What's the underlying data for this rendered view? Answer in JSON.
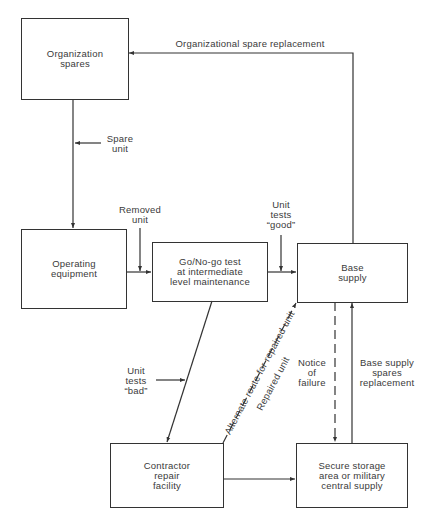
{
  "diagram": {
    "type": "flowchart",
    "nodes": [
      {
        "id": "org_spares",
        "label": "Organization\nspares"
      },
      {
        "id": "operating_equipment",
        "label": "Operating\nequipment"
      },
      {
        "id": "go_nogo",
        "label": "Go/No-go test\nat intermediate\nlevel maintenance"
      },
      {
        "id": "base_supply",
        "label": "Base\nsupply"
      },
      {
        "id": "contractor",
        "label": "Contractor\nrepair\nfacility"
      },
      {
        "id": "secure_storage",
        "label": "Secure storage\narea or military\ncentral supply"
      }
    ],
    "edges": [
      {
        "from": "base_supply",
        "to": "org_spares",
        "label": "Organizational spare replacement",
        "style": "solid"
      },
      {
        "from": "org_spares",
        "to": "operating_equipment",
        "label": "Spare\nunit",
        "style": "solid"
      },
      {
        "from": "operating_equipment",
        "to": "go_nogo",
        "label": "Removed\nunit",
        "style": "solid"
      },
      {
        "from": "go_nogo",
        "to": "base_supply",
        "label": "Unit\ntests\n“good”",
        "style": "solid"
      },
      {
        "from": "go_nogo",
        "to": "contractor",
        "label": "Unit\ntests\n“bad”",
        "style": "solid"
      },
      {
        "from": "contractor",
        "to": "base_supply",
        "label_a": "Alternate route for repaired unit",
        "label_b": "Repaired unit",
        "style": "dashed"
      },
      {
        "from": "contractor",
        "to": "secure_storage",
        "label": "",
        "style": "solid"
      },
      {
        "from": "base_supply",
        "to": "secure_storage",
        "label": "Notice\nof\nfailure",
        "style": "dashed"
      },
      {
        "from": "secure_storage",
        "to": "base_supply",
        "label": "Base supply\nspares\nreplacement",
        "style": "solid"
      }
    ]
  },
  "colors": {
    "line": "#333333",
    "text": "#3a3a3a",
    "background": "#ffffff"
  }
}
